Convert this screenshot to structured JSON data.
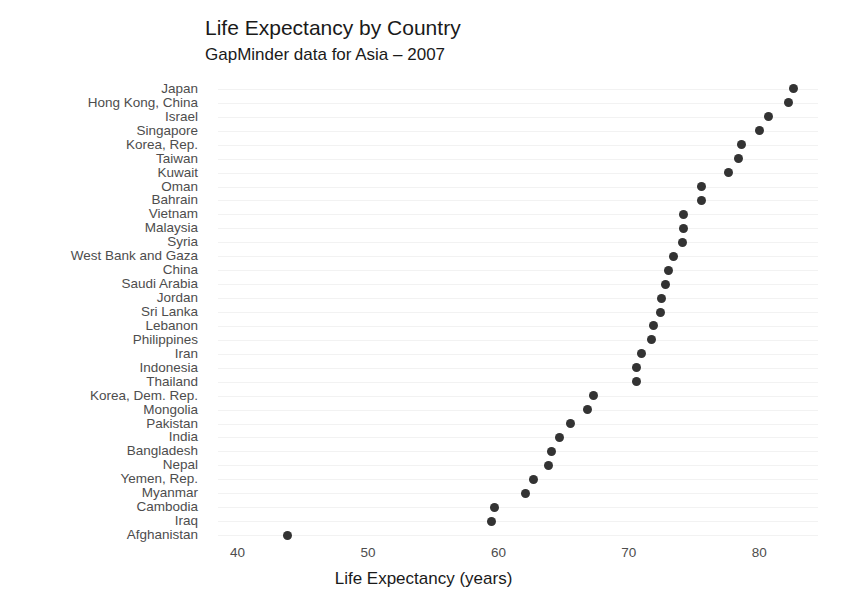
{
  "chart_data": {
    "type": "scatter",
    "title": "Life Expectancy by Country",
    "subtitle": "GapMinder data for Asia – 2007",
    "xlabel": "Life Expectancy (years)",
    "ylabel": "",
    "xlim": [
      38.5,
      84.5
    ],
    "xticks": [
      40,
      50,
      60,
      70,
      80
    ],
    "xtick_labels": [
      "40",
      "50",
      "60",
      "70",
      "80"
    ],
    "grid": "horizontal",
    "legend": "none",
    "sort": "descending by value",
    "marker": {
      "shape": "circle",
      "color": "#333333",
      "size_px": 9
    },
    "categories": [
      "Japan",
      "Hong Kong, China",
      "Israel",
      "Singapore",
      "Korea, Rep.",
      "Taiwan",
      "Kuwait",
      "Oman",
      "Bahrain",
      "Vietnam",
      "Malaysia",
      "Syria",
      "West Bank and Gaza",
      "China",
      "Saudi Arabia",
      "Jordan",
      "Sri Lanka",
      "Lebanon",
      "Philippines",
      "Iran",
      "Indonesia",
      "Thailand",
      "Korea, Dem. Rep.",
      "Mongolia",
      "Pakistan",
      "India",
      "Bangladesh",
      "Nepal",
      "Yemen, Rep.",
      "Myanmar",
      "Cambodia",
      "Iraq",
      "Afghanistan"
    ],
    "values": [
      82.6,
      82.2,
      80.7,
      80.0,
      78.6,
      78.4,
      77.6,
      75.6,
      75.6,
      74.2,
      74.2,
      74.1,
      73.4,
      73.0,
      72.8,
      72.5,
      72.4,
      71.9,
      71.7,
      71.0,
      70.6,
      70.6,
      67.3,
      66.8,
      65.5,
      64.7,
      64.1,
      63.8,
      62.7,
      62.1,
      59.7,
      59.5,
      43.8
    ]
  }
}
